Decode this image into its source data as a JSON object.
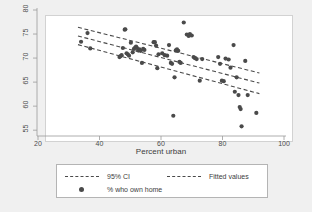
{
  "chart_data": {
    "type": "scatter",
    "title": "",
    "subtitle": "",
    "xlabel": "Percent urban",
    "ylabel": "",
    "xlim": [
      20,
      100
    ],
    "ylim": [
      54,
      80
    ],
    "xticks": [
      20,
      40,
      60,
      80,
      100
    ],
    "yticks": [
      55,
      60,
      65,
      70,
      75,
      80
    ],
    "grid": false,
    "legend_position": "bottom",
    "marker_color": "#4a4a4a",
    "line_color": "#4a4a4a",
    "plot_background": "#ffffff",
    "figure_background": "#f0f0f0",
    "series": [
      {
        "name": "% who own home",
        "type": "scatter",
        "points": [
          [
            34.0,
            73.4
          ],
          [
            36.1,
            75.2
          ],
          [
            37.0,
            72.0
          ],
          [
            46.5,
            70.2
          ],
          [
            46.8,
            70.4
          ],
          [
            47.2,
            70.6
          ],
          [
            47.6,
            72.1
          ],
          [
            48.2,
            75.9
          ],
          [
            48.4,
            76.0
          ],
          [
            48.8,
            71.0
          ],
          [
            49.2,
            70.8
          ],
          [
            49.6,
            70.5
          ],
          [
            50.2,
            73.2
          ],
          [
            50.8,
            71.2
          ],
          [
            51.2,
            71.9
          ],
          [
            51.6,
            72.2
          ],
          [
            51.9,
            72.4
          ],
          [
            52.2,
            72.1
          ],
          [
            52.6,
            71.6
          ],
          [
            53.0,
            71.8
          ],
          [
            53.4,
            71.5
          ],
          [
            53.8,
            69.0
          ],
          [
            54.2,
            71.9
          ],
          [
            54.6,
            71.7
          ],
          [
            57.6,
            73.3
          ],
          [
            58.0,
            73.3
          ],
          [
            58.4,
            72.6
          ],
          [
            58.8,
            67.9
          ],
          [
            59.2,
            70.8
          ],
          [
            60.4,
            71.0
          ],
          [
            61.2,
            70.6
          ],
          [
            62.0,
            70.5
          ],
          [
            62.6,
            72.7
          ],
          [
            63.2,
            69.0
          ],
          [
            63.6,
            68.8
          ],
          [
            64.0,
            58.0
          ],
          [
            64.4,
            66.0
          ],
          [
            64.8,
            71.6
          ],
          [
            65.2,
            71.8
          ],
          [
            65.6,
            71.5
          ],
          [
            66.0,
            69.2
          ],
          [
            66.4,
            69.0
          ],
          [
            67.4,
            77.4
          ],
          [
            68.4,
            74.9
          ],
          [
            69.0,
            74.6
          ],
          [
            69.4,
            75.0
          ],
          [
            70.0,
            74.7
          ],
          [
            70.6,
            70.2
          ],
          [
            71.0,
            70.0
          ],
          [
            71.6,
            69.8
          ],
          [
            72.6,
            65.3
          ],
          [
            73.4,
            69.8
          ],
          [
            78.6,
            70.2
          ],
          [
            79.2,
            68.8
          ],
          [
            79.8,
            65.3
          ],
          [
            80.4,
            65.2
          ],
          [
            81.0,
            69.9
          ],
          [
            82.0,
            69.7
          ],
          [
            82.6,
            68.0
          ],
          [
            83.6,
            72.7
          ],
          [
            84.0,
            63.0
          ],
          [
            84.6,
            66.0
          ],
          [
            85.2,
            62.3
          ],
          [
            85.6,
            59.8
          ],
          [
            85.9,
            59.4
          ],
          [
            86.2,
            55.8
          ],
          [
            87.4,
            69.4
          ],
          [
            88.2,
            62.3
          ],
          [
            91.0,
            58.6
          ]
        ]
      },
      {
        "name": "Fitted values",
        "type": "line",
        "style": "dashed",
        "endpoints": [
          [
            33.0,
            74.6
          ],
          [
            92.0,
            64.8
          ]
        ]
      },
      {
        "name": "95% CI upper",
        "type": "line",
        "style": "dashed",
        "endpoints": [
          [
            33.0,
            76.4
          ],
          [
            92.0,
            66.9
          ]
        ]
      },
      {
        "name": "95% CI lower",
        "type": "line",
        "style": "dashed",
        "endpoints": [
          [
            33.0,
            72.8
          ],
          [
            92.0,
            62.6
          ]
        ]
      }
    ],
    "legend": [
      {
        "label": "95% CI",
        "marker": "dashed-line"
      },
      {
        "label": "Fitted values",
        "marker": "dashed-line"
      },
      {
        "label": "% who own home",
        "marker": "filled-circle"
      }
    ]
  }
}
